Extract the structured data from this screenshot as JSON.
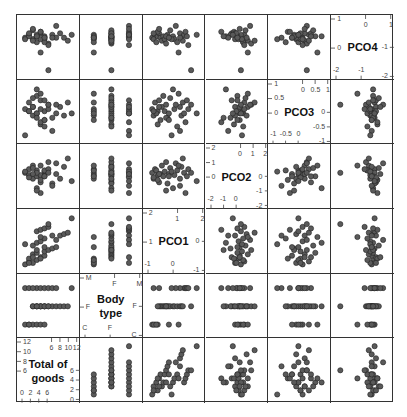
{
  "chart_data": {
    "type": "scatter",
    "title": "",
    "layout": "scatterplot-matrix",
    "variables": [
      "PCO4",
      "PCO3",
      "PCO2",
      "PCO1",
      "Body type",
      "Total of goods"
    ],
    "diagonal_labels": [
      "PCO4",
      "PCO3",
      "PCO2",
      "PCO1",
      "Body\ntype",
      "Total of\ngoods"
    ],
    "ranges": {
      "PCO4": [
        -2.3,
        1.4
      ],
      "PCO3": [
        -1.2,
        1.3
      ],
      "PCO2": [
        -2.3,
        2.3
      ],
      "PCO1": [
        -1.3,
        2.5
      ],
      "Body type": [
        0.5,
        3.5
      ],
      "Total of goods": [
        -0.8,
        12.8
      ]
    },
    "axis_ticks": {
      "PCO4": {
        "top": [
          "0",
          "1"
        ],
        "left": [
          "1",
          "0"
        ],
        "right": [
          "-1",
          "-2"
        ],
        "bottom": [
          "-2",
          "-1"
        ]
      },
      "PCO3": {
        "top": [
          "0",
          "0.5",
          "1"
        ],
        "left": [
          "1",
          "0.5",
          "0"
        ],
        "right": [
          "0",
          "-0.5",
          "-1"
        ],
        "bottom": [
          "-1",
          "-0.5",
          "0"
        ]
      },
      "PCO2": {
        "top": [
          "0",
          "1",
          "2"
        ],
        "left": [
          "2",
          "1",
          "0"
        ],
        "right": [
          "0",
          "-1",
          "-2"
        ],
        "bottom": [
          "-2",
          "-1",
          "0"
        ]
      },
      "PCO1": {
        "top": [
          "1",
          "2"
        ],
        "left": [
          "2",
          "1"
        ],
        "right": [
          "0",
          "-1"
        ],
        "bottom": [
          "-1",
          "0"
        ]
      },
      "Body type": {
        "top": [
          "F",
          "M"
        ],
        "left": [
          "M",
          "F"
        ],
        "right": [
          "F",
          "C"
        ],
        "bottom": [
          "C",
          "F"
        ]
      },
      "Total of goods": {
        "top": [
          "6",
          "8",
          "10",
          "12"
        ],
        "left": [
          "12",
          "10",
          "8",
          "6"
        ],
        "right": [
          "6",
          "4",
          "2",
          "0"
        ],
        "bottom": [
          "0",
          "2",
          "4",
          "6"
        ]
      }
    },
    "body_type_levels": {
      "C": 1,
      "F": 2,
      "M": 3
    },
    "observations": {
      "PCO4": [
        0.2,
        0.4,
        0.1,
        0.3,
        -0.1,
        0.5,
        0.2,
        0.0,
        0.3,
        0.6,
        0.1,
        -0.2,
        0.4,
        0.2,
        0.7,
        0.3,
        0.1,
        -0.1,
        0.5,
        0.2,
        0.0,
        0.4,
        0.6,
        0.3,
        -0.3,
        0.2,
        1.0,
        0.1,
        0.5,
        0.8,
        0.3,
        -0.8,
        -2.0,
        0.4,
        0.2
      ],
      "PCO3": [
        0.2,
        0.5,
        -0.1,
        0.1,
        0.0,
        0.6,
        -0.3,
        0.3,
        0.8,
        -0.5,
        0.1,
        0.4,
        -0.2,
        0.0,
        0.7,
        1.1,
        0.2,
        -0.6,
        0.3,
        -0.1,
        0.5,
        0.0,
        -0.4,
        0.6,
        0.2,
        -0.8,
        0.4,
        -1.0,
        0.1,
        0.3,
        -0.2,
        0.9,
        0.4,
        0.0,
        -0.3
      ],
      "PCO2": [
        0.3,
        0.6,
        -0.2,
        0.1,
        0.5,
        -0.5,
        0.2,
        0.9,
        0.0,
        -0.3,
        0.4,
        1.2,
        -0.6,
        0.2,
        0.7,
        -1.0,
        0.1,
        0.5,
        -0.2,
        0.8,
        1.5,
        0.3,
        -1.4,
        0.0,
        0.6,
        -0.8,
        1.1,
        0.4,
        -0.1,
        0.2,
        -1.2,
        0.9,
        0.3,
        -0.4,
        0.0
      ],
      "PCO1": [
        -1.0,
        -0.8,
        -0.9,
        -0.6,
        -0.7,
        -0.5,
        -0.4,
        -0.3,
        -0.2,
        -0.6,
        -0.1,
        0.0,
        0.1,
        0.2,
        0.3,
        0.5,
        0.6,
        0.8,
        1.0,
        1.1,
        1.2,
        1.3,
        1.4,
        1.5,
        1.6,
        1.0,
        0.7,
        0.4,
        -0.9,
        -0.5,
        0.0,
        0.9,
        1.8,
        2.2,
        0.2
      ],
      "Body type": [
        1,
        1,
        1,
        1,
        1,
        2,
        2,
        2,
        2,
        2,
        2,
        2,
        2,
        2,
        2,
        2,
        2,
        2,
        2,
        2,
        2,
        3,
        3,
        3,
        3,
        3,
        3,
        3,
        3,
        3,
        2,
        1,
        2,
        3,
        1
      ],
      "Total of goods": [
        0,
        1,
        2,
        1,
        3,
        4,
        5,
        2,
        3,
        4,
        5,
        6,
        7,
        8,
        2,
        3,
        4,
        5,
        9,
        10,
        11,
        3,
        4,
        5,
        6,
        7,
        8,
        0,
        1,
        2,
        3,
        4,
        6,
        12,
        5
      ]
    }
  }
}
